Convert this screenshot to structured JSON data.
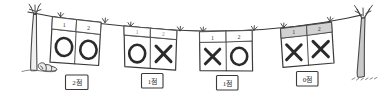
{
  "scene": {
    "title": "Clothesline with O/X answer cards",
    "background_color": "#ffffff",
    "ink_color": "#3a3a3a",
    "shade_color": "#d2d2d2",
    "trunk_color": "#c9c9c9"
  },
  "left_tree": {
    "name": "left-tree",
    "label": "tree"
  },
  "right_tree": {
    "name": "right-tree",
    "label": "tree"
  },
  "ground_rock": {
    "name": "ground-rock",
    "label": "rock"
  },
  "clothesline": {
    "name": "clothesline",
    "label": "line"
  },
  "cards": [
    {
      "id": "card-1",
      "headers": [
        "1",
        "2"
      ],
      "header_shaded": false,
      "header_faint": false,
      "cells": [
        "O",
        "O"
      ],
      "score": "2점"
    },
    {
      "id": "card-2",
      "headers": [
        "1",
        "2"
      ],
      "header_shaded": false,
      "header_faint": true,
      "cells": [
        "O",
        "X"
      ],
      "score": "1점"
    },
    {
      "id": "card-3",
      "headers": [
        "1",
        "2"
      ],
      "header_shaded": false,
      "header_faint": false,
      "cells": [
        "X",
        "O"
      ],
      "score": "1점"
    },
    {
      "id": "card-4",
      "headers": [
        "1",
        "2"
      ],
      "header_shaded": true,
      "header_faint": false,
      "cells": [
        "X",
        "X"
      ],
      "score": "0점"
    }
  ]
}
